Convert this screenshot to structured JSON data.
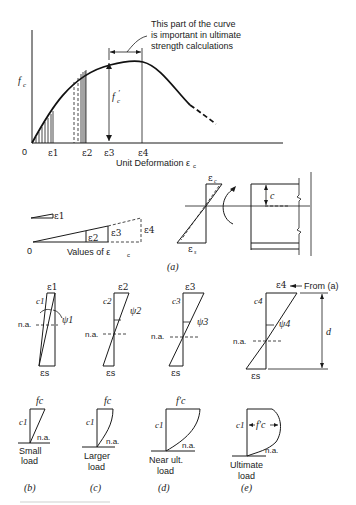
{
  "main_graph": {
    "y_axis_label": "f",
    "y_axis_sub": "c",
    "origin_label": "0",
    "x_ticks": [
      "ε1",
      "ε2",
      "ε3",
      "ε4"
    ],
    "x_axis_label": "Unit Deformation ε",
    "x_axis_sub": "c",
    "peak_label": "f",
    "peak_sub": "c",
    "peak_prime": "′",
    "annotation_line1": "This part of the curve",
    "annotation_line2": "is important in ultimate",
    "annotation_line3": "strength calculations"
  },
  "strain_values": {
    "labels": [
      "ε1",
      "ε2",
      "ε3",
      "ε4"
    ],
    "origin_label": "0",
    "axis_label": "Values of ε",
    "axis_sub": "c"
  },
  "beam_section": {
    "top_strain": "ε",
    "top_sub": "c",
    "bottom_strain": "ε",
    "bottom_sub": "s",
    "depth_label": "c"
  },
  "panel_a_label": "(a)",
  "strain_profiles": [
    {
      "top": "ε1",
      "c": "c1",
      "psi": "ψ1",
      "na": "n.a.",
      "bottom": "εs"
    },
    {
      "top": "ε2",
      "c": "c2",
      "psi": "ψ2",
      "na": "n.a.",
      "bottom": "εs"
    },
    {
      "top": "ε3",
      "c": "c3",
      "psi": "ψ3",
      "na": "n.a.",
      "bottom": "εs"
    },
    {
      "top": "ε4",
      "c": "c4",
      "psi": "ψ4",
      "na": "n.a.",
      "bottom": "εs",
      "from_label": "From (a)",
      "depth": "d"
    }
  ],
  "stress_blocks": [
    {
      "top": "fc",
      "c": "c1",
      "na": "n.a.",
      "caption1": "Small",
      "caption2": "load",
      "panel": "(b)"
    },
    {
      "top": "fc",
      "c": "c1",
      "na": "n.a.",
      "caption1": "Larger",
      "caption2": "load",
      "panel": "(c)"
    },
    {
      "top": "f′c",
      "c": "c1",
      "na": "n.a.",
      "caption1": "Near ult.",
      "caption2": "load",
      "panel": "(d)"
    },
    {
      "top": "f′c",
      "c": "c1",
      "na": "n.a.",
      "caption1": "Ultimate",
      "caption2": "load",
      "panel": "(e)"
    }
  ]
}
